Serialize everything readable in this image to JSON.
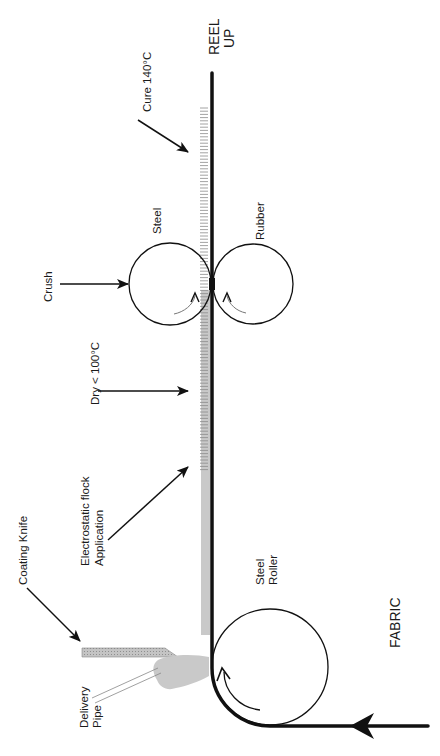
{
  "diagram": {
    "title_top": {
      "line1": "REEL",
      "line2": "UP"
    },
    "labels": {
      "cure": "Cure 140°C",
      "steel_top": "Steel",
      "rubber": "Rubber",
      "crush": "Crush",
      "dry": "Dry < 100°C",
      "flock_line1": "Electrostatic flock",
      "flock_line2": "Application",
      "coating_knife": "Coating Knife",
      "steel_roller_line1": "Steel",
      "steel_roller_line2": "Roller",
      "delivery_line1": "Delivery",
      "delivery_line2": "Pipe",
      "fabric": "FABRIC"
    },
    "colors": {
      "line": "#111111",
      "coating_gray": "#c8c8c8",
      "knife_fill": "#bdbdbd",
      "hatch": "#8a8a8a"
    }
  }
}
